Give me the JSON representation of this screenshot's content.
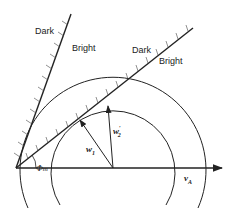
{
  "diagram": {
    "labels": {
      "dark_upper": "Dark",
      "bright_upper": "Bright",
      "dark_lower": "Dark",
      "bright_lower": "Bright",
      "w1": "w",
      "w1_sub": "1",
      "w2": "w",
      "w2_sub": "2",
      "w2_prime": "′",
      "phi": "Φ",
      "phi_sub": "m",
      "va": "v",
      "va_sub": "A"
    },
    "colors": {
      "stroke": "#222222",
      "background": "#ffffff"
    }
  }
}
